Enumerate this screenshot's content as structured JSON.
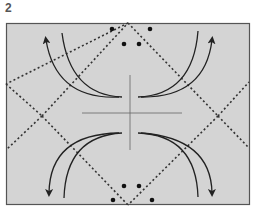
{
  "step": {
    "number": "2"
  },
  "diagram": {
    "paper_color": "#d4d4d4",
    "border_color": "#555555",
    "line_color": "#333333",
    "elements": {
      "valley_fold_lines": 4,
      "reference_dots": 8,
      "fold_arrows": 4,
      "center_crease_lines": 2
    }
  }
}
